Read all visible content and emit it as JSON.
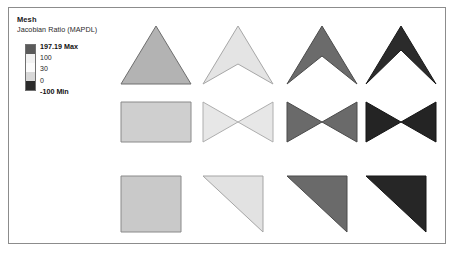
{
  "legend": {
    "title": "Mesh",
    "subtitle": "Jacobian Ratio (MAPDL)",
    "labels": [
      {
        "text": "197.19 Max",
        "bold": true
      },
      {
        "text": "100",
        "bold": false
      },
      {
        "text": "30",
        "bold": false
      },
      {
        "text": "0",
        "bold": false
      },
      {
        "text": "-100 Min",
        "bold": true
      }
    ],
    "colorbar_bands": [
      "#5a5a5a",
      "#f2f2f2",
      "#fbfbfb",
      "#d8d8d8",
      "#2a2a2a"
    ],
    "scale_max": 197.19,
    "scale_min": -100,
    "scale_ticks": [
      197.19,
      100,
      30,
      0,
      -100
    ]
  },
  "grid": {
    "columns": 4,
    "rows": 3,
    "column_x": [
      0,
      82,
      166,
      245
    ],
    "row_y": [
      0,
      76,
      150
    ],
    "cells": [
      {
        "name": "triangle-good",
        "row": 0,
        "col": 0,
        "fill": "#b3b3b3",
        "stroke": "#6e6e6e",
        "width": 74,
        "height": 62,
        "points": "37,2 72,60 2,60"
      },
      {
        "name": "triangle-concave-light",
        "row": 0,
        "col": 1,
        "fill": "#e4e4e4",
        "stroke": "#a7a7a7",
        "width": 74,
        "height": 62,
        "points": "37,2 72,60 37,40 2,60"
      },
      {
        "name": "triangle-concave-mid",
        "row": 0,
        "col": 2,
        "fill": "#6b6b6b",
        "stroke": "#4b4b4b",
        "width": 74,
        "height": 62,
        "points": "37,2 72,60 37,32 2,60"
      },
      {
        "name": "triangle-concave-dark",
        "row": 0,
        "col": 3,
        "fill": "#2b2b2b",
        "stroke": "#1a1a1a",
        "width": 74,
        "height": 62,
        "points": "37,2 72,60 37,26 2,60"
      },
      {
        "name": "rectangle-good",
        "row": 1,
        "col": 0,
        "fill": "#cfcfcf",
        "stroke": "#8a8a8a",
        "width": 74,
        "height": 44,
        "points": "2,2 72,2 72,42 2,42"
      },
      {
        "name": "bowtie-light",
        "row": 1,
        "col": 1,
        "fill": "#e7e7e7",
        "stroke": "#aeaeae",
        "width": 74,
        "height": 44,
        "points": "2,2 72,42 72,2 2,42"
      },
      {
        "name": "bowtie-mid",
        "row": 1,
        "col": 2,
        "fill": "#6a6a6a",
        "stroke": "#4a4a4a",
        "width": 74,
        "height": 44,
        "points": "2,2 72,42 72,2 2,42"
      },
      {
        "name": "bowtie-dark",
        "row": 1,
        "col": 3,
        "fill": "#242424",
        "stroke": "#141414",
        "width": 74,
        "height": 44,
        "points": "2,2 72,42 72,2 2,42"
      },
      {
        "name": "square-good",
        "row": 2,
        "col": 0,
        "fill": "#c9c9c9",
        "stroke": "#8a8a8a",
        "width": 66,
        "height": 60,
        "points": "2,2 62,2 62,58 2,58"
      },
      {
        "name": "right-triangle-light",
        "row": 2,
        "col": 1,
        "fill": "#e2e2e2",
        "stroke": "#a5a5a5",
        "width": 66,
        "height": 60,
        "points": "2,2 62,2 62,58"
      },
      {
        "name": "right-triangle-mid",
        "row": 2,
        "col": 2,
        "fill": "#6a6a6a",
        "stroke": "#4a4a4a",
        "width": 66,
        "height": 60,
        "points": "2,2 62,2 62,58"
      },
      {
        "name": "right-triangle-dark",
        "row": 2,
        "col": 3,
        "fill": "#262626",
        "stroke": "#161616",
        "width": 66,
        "height": 60,
        "points": "2,2 62,2 62,58"
      }
    ]
  }
}
